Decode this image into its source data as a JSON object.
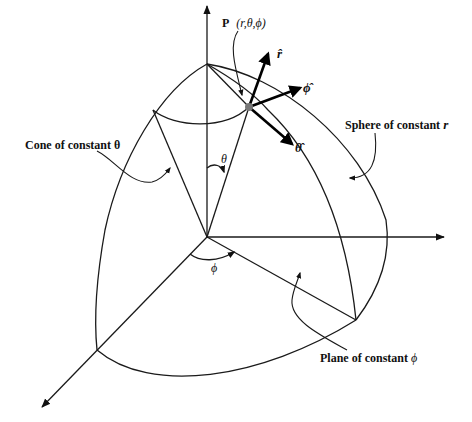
{
  "diagram": {
    "point_label": {
      "prefix": "P",
      "coords": "(r,θ,ϕ)"
    },
    "unit_vectors": {
      "r": "r̂",
      "theta": "θ̂",
      "phi": "ϕ̂"
    },
    "angle_labels": {
      "theta": "θ",
      "phi": "ϕ"
    },
    "callouts": {
      "cone": "Cone of constant θ",
      "sphere_prefix": "Sphere of constant ",
      "sphere_var": "r",
      "plane_prefix": "Plane of constant ",
      "plane_var": "ϕ"
    },
    "colors": {
      "line": "#1a1a1a",
      "point": "#777777",
      "background": "#ffffff"
    }
  }
}
